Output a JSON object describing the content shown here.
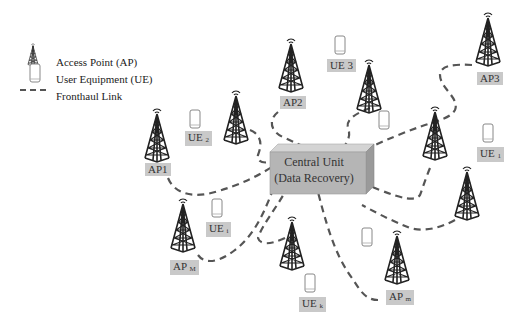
{
  "legend": {
    "items": [
      {
        "icon": "tower-icon",
        "label": "Access Point (AP)"
      },
      {
        "icon": "phone-icon",
        "label": "User Equipment (UE)"
      },
      {
        "icon": "dashed-line-icon",
        "label": "Fronthaul Link"
      }
    ]
  },
  "central_unit": {
    "line1": "Central Unit",
    "line2": "(Data Recovery)",
    "color": "#b5b5b5"
  },
  "access_points": [
    {
      "label": "AP1",
      "sub": ""
    },
    {
      "label": "AP2",
      "sub": ""
    },
    {
      "label": "AP3",
      "sub": ""
    },
    {
      "label": "AP",
      "sub": "M"
    },
    {
      "label": "AP",
      "sub": "m"
    }
  ],
  "user_equipments": [
    {
      "label": "UE",
      "sub": "2"
    },
    {
      "label": "UE 3",
      "sub": ""
    },
    {
      "label": "UE",
      "sub": "1"
    },
    {
      "label": "UE",
      "sub": "i"
    },
    {
      "label": "UE",
      "sub": "k"
    }
  ],
  "colors": {
    "link": "#555555",
    "label_bg": "#c9c9c9",
    "tower": "#222222"
  }
}
